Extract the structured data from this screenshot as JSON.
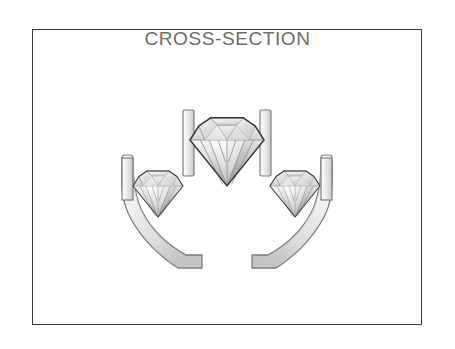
{
  "figure": {
    "title": "CROSS-SECTION",
    "title_color": "#6d6d6d",
    "background_color": "#ffffff",
    "frame_border_color": "#3a3a3a"
  },
  "palette": {
    "metal_light": "#f4f4f4",
    "metal_mid": "#e0e0e0",
    "metal_shadow": "#c3c3c3",
    "metal_outline": "#7c7c7c",
    "gem_outline": "#3c3c3c",
    "gem_facet_line": "#8a8a8a",
    "gem_light": "#fbfbfb",
    "gem_mid": "#dcdcdc",
    "gem_dark": "#b0b0b0"
  },
  "components": {
    "gems": [
      {
        "name": "center-diamond",
        "cut": "round-brilliant",
        "position": "center",
        "cx": 227,
        "cy": 140,
        "half_width": 37,
        "crown_height": 22,
        "pavilion_depth": 45,
        "scale": 1.0
      },
      {
        "name": "left-diamond",
        "cut": "round-brilliant",
        "position": "left",
        "cx": 158,
        "cy": 186,
        "half_width": 25,
        "crown_height": 15,
        "pavilion_depth": 30,
        "scale": 0.67
      },
      {
        "name": "right-diamond",
        "cut": "round-brilliant",
        "position": "right",
        "cx": 295,
        "cy": 186,
        "half_width": 25,
        "crown_height": 15,
        "pavilion_depth": 30,
        "scale": 0.67
      }
    ],
    "prongs": [
      {
        "name": "prong-center-left",
        "x": 183,
        "y": 110,
        "width": 11,
        "height": 66
      },
      {
        "name": "prong-center-right",
        "x": 260,
        "y": 110,
        "width": 11,
        "height": 66
      },
      {
        "name": "prong-outer-left",
        "x": 122,
        "y": 158,
        "width": 11,
        "height": 42
      },
      {
        "name": "prong-outer-right",
        "x": 321,
        "y": 158,
        "width": 11,
        "height": 42
      }
    ],
    "shank_arms": [
      {
        "name": "shank-arm-left",
        "side": "left",
        "terminates_at": "flat-cut-end"
      },
      {
        "name": "shank-arm-right",
        "side": "right",
        "terminates_at": "flat-cut-end"
      }
    ]
  }
}
